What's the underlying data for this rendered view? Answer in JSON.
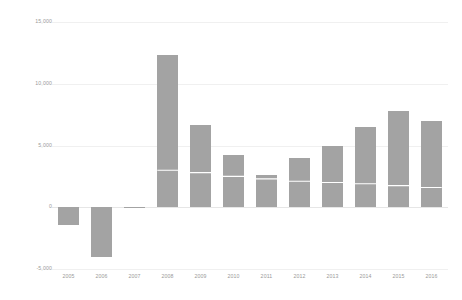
{
  "chart_data": {
    "type": "bar",
    "title": "",
    "subtitle": "",
    "xlabel": "",
    "ylabel": "",
    "categories": [
      "2005",
      "2006",
      "2007",
      "2008",
      "2009",
      "2010",
      "2011",
      "2012",
      "2013",
      "2014",
      "2015",
      "2016"
    ],
    "values": [
      -1400,
      -4000,
      -50,
      12300,
      6700,
      4200,
      2600,
      4000,
      5000,
      6500,
      7800,
      7000
    ],
    "series": [
      {
        "name": "bars",
        "type": "bar",
        "values": [
          -1400,
          -4000,
          -50,
          12300,
          6700,
          4200,
          2600,
          4000,
          5000,
          6500,
          7800,
          7000
        ]
      },
      {
        "name": "overlay-line",
        "type": "line",
        "color": "#ffffff",
        "values": [
          null,
          null,
          null,
          3000,
          2800,
          2500,
          2300,
          2100,
          2000,
          1900,
          1750,
          1600
        ]
      }
    ],
    "ylim": [
      -5000,
      15000
    ],
    "y_ticks": [
      -5000,
      0,
      5000,
      10000,
      15000
    ],
    "y_tick_labels": [
      "-5,000",
      "0",
      "5,000",
      "10,000",
      "15,000"
    ],
    "grid": true,
    "legend": "none",
    "bar_color": "#a3a3a3",
    "grid_color": "#f0f0f0",
    "axis_text_color": "#9a9a9a",
    "background_color": "#ffffff"
  }
}
